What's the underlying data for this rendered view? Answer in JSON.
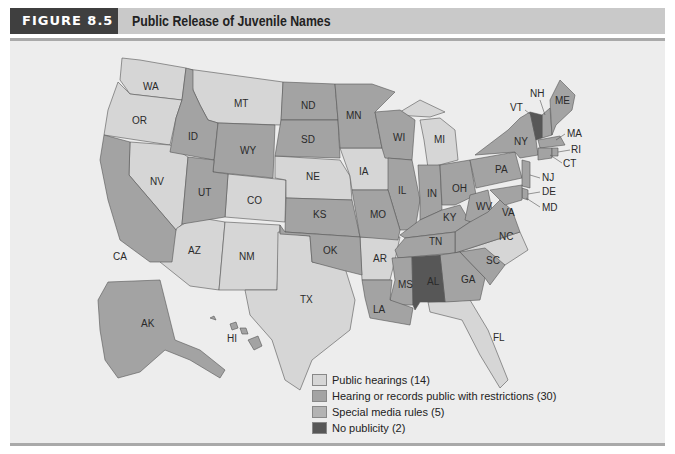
{
  "header": {
    "figure_tag": "FIGURE 8.5",
    "title": "Public Release of Juvenile Names"
  },
  "colors": {
    "public_hearings": "#d6d6d6",
    "restrictions": "#a3a3a3",
    "special_media": "#b3b3b3",
    "no_publicity": "#575757",
    "background": "#ededed",
    "header_bar": "#c9c9c9",
    "figure_tag_bg": "#3f3f3f"
  },
  "legend": {
    "items": [
      {
        "key": "public_hearings",
        "label": "Public hearings (14)",
        "color": "#d6d6d6",
        "count": 14
      },
      {
        "key": "restrictions",
        "label": "Hearing or records public with restrictions (30)",
        "color": "#a3a3a3",
        "count": 30
      },
      {
        "key": "special_media",
        "label": "Special media rules (5)",
        "color": "#b3b3b3",
        "count": 5
      },
      {
        "key": "no_publicity",
        "label": "No publicity (2)",
        "color": "#575757",
        "count": 2
      }
    ]
  },
  "map": {
    "state_labels": [
      "WA",
      "OR",
      "CA",
      "NV",
      "ID",
      "MT",
      "WY",
      "UT",
      "CO",
      "AZ",
      "NM",
      "ND",
      "SD",
      "NE",
      "KS",
      "OK",
      "TX",
      "MN",
      "IA",
      "MO",
      "AR",
      "LA",
      "WI",
      "IL",
      "MI",
      "IN",
      "OH",
      "KY",
      "TN",
      "MS",
      "AL",
      "GA",
      "FL",
      "SC",
      "NC",
      "VA",
      "WV",
      "PA",
      "NY",
      "VT",
      "NH",
      "ME",
      "MA",
      "RI",
      "CT",
      "NJ",
      "DE",
      "MD",
      "AK",
      "HI"
    ],
    "categories": {
      "public_hearings": [
        "WA",
        "OR",
        "MT",
        "NV",
        "CO",
        "AZ",
        "NM",
        "NE",
        "IA",
        "MI",
        "TX",
        "AR",
        "NC",
        "FL"
      ],
      "no_publicity": [
        "VT",
        "AL"
      ]
    }
  }
}
